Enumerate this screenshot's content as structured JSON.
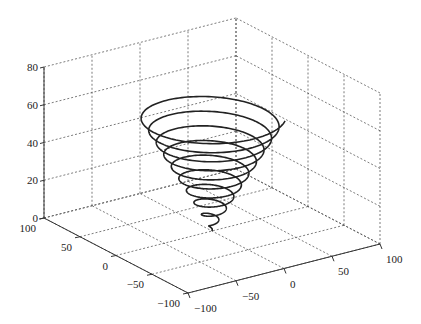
{
  "chart_data": {
    "type": "line3d",
    "title": "",
    "xlabel": "",
    "ylabel": "",
    "zlabel": "",
    "xlim": [
      -100,
      100
    ],
    "ylim": [
      -100,
      100
    ],
    "zlim": [
      0,
      80
    ],
    "x_ticks": [
      -100,
      -50,
      0,
      50,
      100
    ],
    "y_ticks": [
      -100,
      -50,
      0,
      50,
      100
    ],
    "z_ticks": [
      0,
      20,
      40,
      60,
      80
    ],
    "x_tick_labels": [
      "−100",
      "−50",
      "0",
      "50",
      "100"
    ],
    "y_tick_labels": [
      "−100",
      "−50",
      "0",
      "50",
      "100"
    ],
    "z_tick_labels": [
      "0",
      "20",
      "40",
      "60",
      "80"
    ],
    "grid": true,
    "legend": null,
    "series": [
      {
        "name": "conical spiral",
        "equation": "x = t cos t, y = t sin t, z = t",
        "t_range": [
          0,
          62
        ],
        "color": "#222222"
      }
    ]
  },
  "style": {
    "grid_color": "#444444",
    "axis_color": "#333333",
    "line_color": "#222222"
  }
}
